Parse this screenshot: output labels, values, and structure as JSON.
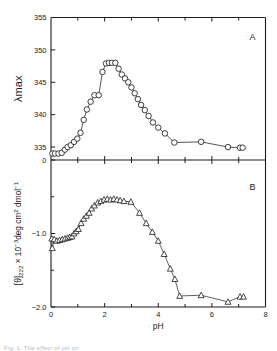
{
  "figure": {
    "panel_a_label": "A",
    "panel_b_label": "B",
    "caption": "Fig. 1. The effect of pH on"
  },
  "chart_data": [
    {
      "type": "scatter",
      "panel": "A",
      "title": "",
      "xlabel": "pH",
      "ylabel": "λmax",
      "xlim": [
        0,
        8
      ],
      "ylim": [
        333,
        355
      ],
      "y_axis_break_label": "0",
      "xticks": [
        0,
        2,
        4,
        6,
        8
      ],
      "xticklabels": [
        "0",
        "2",
        "4",
        "6",
        "8"
      ],
      "xminorticks": [
        1,
        3,
        5,
        7
      ],
      "yticks": [
        335,
        340,
        345,
        350,
        355
      ],
      "yticklabels": [
        "335",
        "340",
        "345",
        "350",
        "355"
      ],
      "marker": "open-circle",
      "grid": false,
      "legend": "none",
      "x": [
        0.05,
        0.15,
        0.28,
        0.4,
        0.52,
        0.62,
        0.74,
        0.86,
        0.98,
        1.1,
        1.22,
        1.34,
        1.48,
        1.62,
        1.78,
        1.92,
        2.05,
        2.16,
        2.27,
        2.4,
        2.52,
        2.64,
        2.76,
        2.88,
        3.0,
        3.12,
        3.24,
        3.36,
        3.5,
        3.64,
        3.8,
        4.0,
        4.25,
        4.6,
        5.6,
        6.6,
        7.05,
        7.15
      ],
      "y": [
        334.0,
        334.0,
        334.0,
        334.1,
        334.6,
        335.0,
        335.3,
        335.8,
        336.3,
        337.2,
        339.2,
        340.8,
        342.0,
        343.0,
        343.0,
        346.6,
        347.9,
        348.0,
        348.0,
        348.0,
        347.1,
        346.2,
        345.6,
        345.0,
        344.2,
        343.3,
        342.4,
        341.5,
        340.7,
        339.8,
        338.8,
        338.0,
        337.1,
        335.7,
        335.8,
        335.0,
        334.9,
        334.9
      ]
    },
    {
      "type": "scatter",
      "panel": "B",
      "title": "",
      "xlabel": "pH",
      "ylabel": "[θ]222 × 10−3deg cm2 dmol−1",
      "xlim": [
        0,
        8
      ],
      "ylim": [
        -2.0,
        0.0
      ],
      "xticks": [
        0,
        2,
        4,
        6,
        8
      ],
      "xticklabels": [
        "0",
        "2",
        "4",
        "6",
        "8"
      ],
      "xminorticks": [
        1,
        3,
        5,
        7
      ],
      "yticks": [
        0.0,
        -1.0,
        -2.0
      ],
      "yticklabels": [
        "0",
        "−1.0",
        "−2.0"
      ],
      "yminorticks": [
        -0.5,
        -1.5
      ],
      "marker": "open-triangle",
      "grid": false,
      "legend": "none",
      "x": [
        0.03,
        0.05,
        0.12,
        0.22,
        0.32,
        0.42,
        0.52,
        0.62,
        0.7,
        0.78,
        0.86,
        0.94,
        1.02,
        1.12,
        1.22,
        1.32,
        1.42,
        1.52,
        1.62,
        1.74,
        1.86,
        1.98,
        2.1,
        2.22,
        2.34,
        2.46,
        2.58,
        2.72,
        2.98,
        3.3,
        3.55,
        3.78,
        4.0,
        4.22,
        4.45,
        4.62,
        4.8,
        5.6,
        6.6,
        7.05,
        7.18
      ],
      "y": [
        -1.07,
        -1.2,
        -1.08,
        -1.1,
        -1.09,
        -1.08,
        -1.07,
        -1.06,
        -1.05,
        -1.04,
        -1.0,
        -0.97,
        -0.94,
        -0.86,
        -0.8,
        -0.76,
        -0.72,
        -0.66,
        -0.62,
        -0.58,
        -0.56,
        -0.54,
        -0.53,
        -0.54,
        -0.53,
        -0.54,
        -0.55,
        -0.56,
        -0.57,
        -0.72,
        -0.86,
        -0.98,
        -1.1,
        -1.28,
        -1.48,
        -1.62,
        -1.85,
        -1.84,
        -1.93,
        -1.86,
        -1.86
      ]
    }
  ]
}
